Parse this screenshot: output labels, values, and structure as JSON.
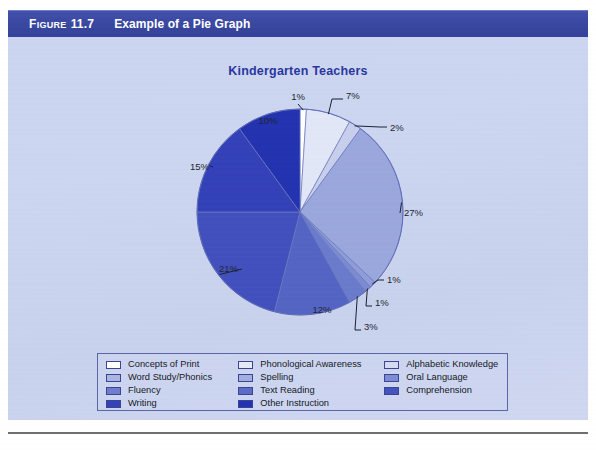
{
  "figure": {
    "label": "Figure",
    "number": "11.7",
    "title": "Example of a Pie Graph",
    "bar_color": "#39479f"
  },
  "chart_data": {
    "type": "pie",
    "title": "Kindergarten Teachers",
    "xlabel": "",
    "ylabel": "",
    "legend_position": "bottom",
    "start_angle_deg": -90,
    "direction": "clockwise",
    "categories": [
      "Concepts of Print",
      "Phonological Awareness",
      "Alphabetic Knowledge",
      "Word Study/Phonics",
      "Spelling",
      "Oral Language",
      "Fluency",
      "Text Reading",
      "Comprehension",
      "Writing",
      "Other Instruction"
    ],
    "values": [
      1,
      7,
      2,
      27,
      1,
      1,
      3,
      12,
      21,
      15,
      10
    ],
    "value_labels": [
      "1%",
      "7%",
      "2%",
      "27%",
      "1%",
      "1%",
      "3%",
      "12%",
      "21%",
      "15%",
      "10%"
    ],
    "colors": [
      "#ffffff",
      "#e2e7f7",
      "#c7cfec",
      "#9aa7dd",
      "#8e9cd8",
      "#7b8bd2",
      "#6b7bcc",
      "#5464c4",
      "#4150bd",
      "#3341b8",
      "#2332b0"
    ]
  },
  "legend": {
    "rows": [
      [
        {
          "label": "Concepts of Print",
          "color": "#ffffff"
        },
        {
          "label": "Phonological Awareness",
          "color": "#e6eaf8"
        },
        {
          "label": "Alphabetic Knowledge",
          "color": "#d3daf1"
        }
      ],
      [
        {
          "label": "Word Study/Phonics",
          "color": "#aab5e2"
        },
        {
          "label": "Spelling",
          "color": "#a3afe0"
        },
        {
          "label": "Oral Language",
          "color": "#7d8cd3"
        }
      ],
      [
        {
          "label": "Fluency",
          "color": "#6e7dcd"
        },
        {
          "label": "Text Reading",
          "color": "#5d6cc7"
        },
        {
          "label": "Comprehension",
          "color": "#4453bf"
        }
      ],
      [
        {
          "label": "Writing",
          "color": "#3442b9"
        },
        {
          "label": "Other Instruction",
          "color": "#2231b1"
        },
        {
          "label": "",
          "color": ""
        }
      ]
    ]
  },
  "callouts": [
    {
      "text": "1%",
      "x": 298,
      "y": 98
    },
    {
      "text": "7%",
      "x": 340,
      "y": 97
    },
    {
      "text": "2%",
      "x": 384,
      "y": 129
    },
    {
      "text": "27%",
      "x": 400,
      "y": 213
    },
    {
      "text": "1%",
      "x": 381,
      "y": 280
    },
    {
      "text": "1%",
      "x": 369,
      "y": 303
    },
    {
      "text": "3%",
      "x": 359,
      "y": 327
    },
    {
      "text": "12%",
      "x": 317,
      "y": 310
    },
    {
      "text": "21%",
      "x": 234,
      "y": 269
    },
    {
      "text": "15%",
      "x": 205,
      "y": 167
    },
    {
      "text": "10%",
      "x": 265,
      "y": 121
    }
  ]
}
